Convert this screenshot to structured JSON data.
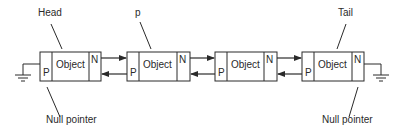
{
  "diagram": {
    "type": "doubly-linked-list",
    "labels": {
      "head": "Head",
      "current": "p",
      "tail": "Tail",
      "null_left": "Null pointer",
      "null_right": "Null pointer"
    },
    "nodes": [
      {
        "prev": "P",
        "object": "Object",
        "next": "N"
      },
      {
        "prev": "P",
        "object": "Object",
        "next": "N"
      },
      {
        "prev": "P",
        "object": "Object",
        "next": "N"
      },
      {
        "prev": "P",
        "object": "Object",
        "next": "N"
      }
    ],
    "colors": {
      "stroke": "#2a2a2a",
      "background": "#ffffff"
    }
  }
}
